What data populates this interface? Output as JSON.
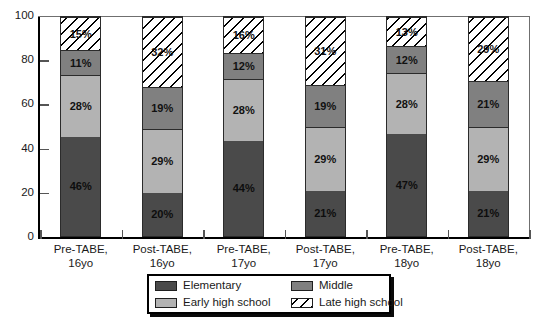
{
  "chart_data": {
    "type": "bar",
    "stacked": true,
    "title": "",
    "subtitle": "",
    "xlabel": "",
    "ylabel": "",
    "ylim": [
      0,
      100
    ],
    "yticks": [
      0,
      20,
      40,
      60,
      80,
      100
    ],
    "grid": false,
    "legend_position": "bottom",
    "categories": [
      "Pre-TABE, 16yo",
      "Post-TABE, 16yo",
      "Pre-TABE, 17yo",
      "Post-TABE, 17yo",
      "Pre-TABE, 18yo",
      "Post-TABE, 18yo"
    ],
    "series": [
      {
        "name": "Elementary",
        "values": [
          46,
          20,
          44,
          21,
          47,
          21
        ]
      },
      {
        "name": "Early high school",
        "values": [
          28,
          29,
          28,
          29,
          28,
          29
        ]
      },
      {
        "name": "Middle",
        "values": [
          11,
          19,
          12,
          19,
          12,
          21
        ]
      },
      {
        "name": "Late high school",
        "values": [
          15,
          32,
          16,
          31,
          13,
          29
        ]
      }
    ],
    "value_format": "percent"
  },
  "axes": {
    "y_tick_labels": [
      "0",
      "20",
      "40",
      "60",
      "80",
      "100"
    ]
  },
  "x_labels": [
    {
      "line1": "Pre-TABE,",
      "line2": "16yo"
    },
    {
      "line1": "Post-TABE,",
      "line2": "16yo"
    },
    {
      "line1": "Pre-TABE,",
      "line2": "17yo"
    },
    {
      "line1": "Post-TABE,",
      "line2": "17yo"
    },
    {
      "line1": "Pre-TABE,",
      "line2": "18yo"
    },
    {
      "line1": "Post-TABE,",
      "line2": "18yo"
    }
  ],
  "bars": [
    {
      "category": "Pre-TABE, 16yo",
      "segments": [
        {
          "series": "Elementary",
          "value": 46,
          "label": "46%"
        },
        {
          "series": "Early high school",
          "value": 28,
          "label": "28%"
        },
        {
          "series": "Middle",
          "value": 11,
          "label": "11%"
        },
        {
          "series": "Late high school",
          "value": 15,
          "label": "15%"
        }
      ]
    },
    {
      "category": "Post-TABE, 16yo",
      "segments": [
        {
          "series": "Elementary",
          "value": 20,
          "label": "20%"
        },
        {
          "series": "Early high school",
          "value": 29,
          "label": "29%"
        },
        {
          "series": "Middle",
          "value": 19,
          "label": "19%"
        },
        {
          "series": "Late high school",
          "value": 32,
          "label": "32%"
        }
      ]
    },
    {
      "category": "Pre-TABE, 17yo",
      "segments": [
        {
          "series": "Elementary",
          "value": 44,
          "label": "44%"
        },
        {
          "series": "Early high school",
          "value": 28,
          "label": "28%"
        },
        {
          "series": "Middle",
          "value": 12,
          "label": "12%"
        },
        {
          "series": "Late high school",
          "value": 16,
          "label": "16%"
        }
      ]
    },
    {
      "category": "Post-TABE, 17yo",
      "segments": [
        {
          "series": "Elementary",
          "value": 21,
          "label": "21%"
        },
        {
          "series": "Early high school",
          "value": 29,
          "label": "29%"
        },
        {
          "series": "Middle",
          "value": 19,
          "label": "19%"
        },
        {
          "series": "Late high school",
          "value": 31,
          "label": "31%"
        }
      ]
    },
    {
      "category": "Pre-TABE, 18yo",
      "segments": [
        {
          "series": "Elementary",
          "value": 47,
          "label": "47%"
        },
        {
          "series": "Early high school",
          "value": 28,
          "label": "28%"
        },
        {
          "series": "Middle",
          "value": 12,
          "label": "12%"
        },
        {
          "series": "Late high school",
          "value": 13,
          "label": "13%"
        }
      ]
    },
    {
      "category": "Post-TABE, 18yo",
      "segments": [
        {
          "series": "Elementary",
          "value": 21,
          "label": "21%"
        },
        {
          "series": "Early high school",
          "value": 29,
          "label": "29%"
        },
        {
          "series": "Middle",
          "value": 21,
          "label": "21%"
        },
        {
          "series": "Late high school",
          "value": 29,
          "label": "29%"
        }
      ]
    }
  ],
  "legend": {
    "items": [
      {
        "label": "Elementary",
        "style": "solid",
        "color": "#4a4a4a"
      },
      {
        "label": "Middle",
        "style": "solid",
        "color": "#808080"
      },
      {
        "label": "Early high school",
        "style": "solid",
        "color": "#b3b3b3"
      },
      {
        "label": "Late high school",
        "style": "hatch",
        "color": "#ffffff"
      }
    ]
  },
  "colors": {
    "elementary": "#4a4a4a",
    "early_high_school": "#b3b3b3",
    "middle": "#808080",
    "late_high_school": "#ffffff",
    "axis": "#000000",
    "background": "#ffffff"
  }
}
